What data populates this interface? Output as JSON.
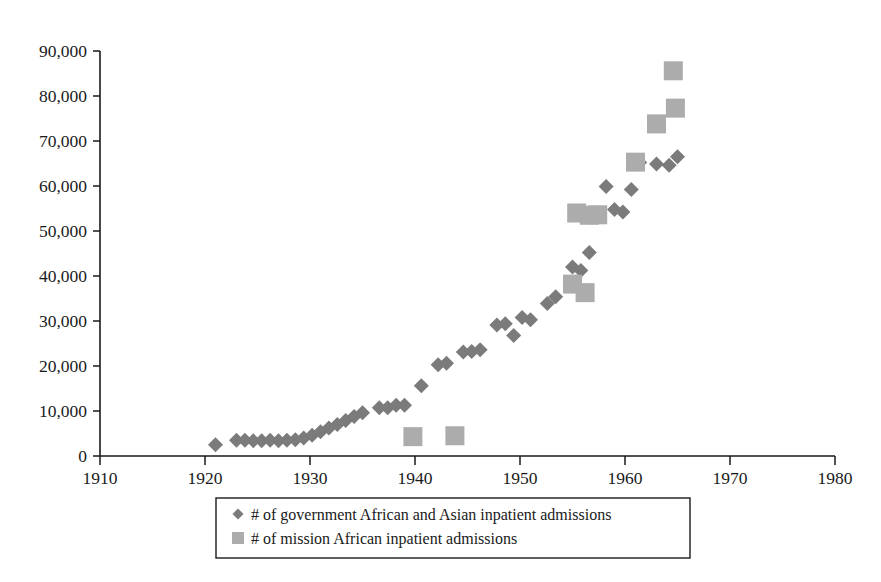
{
  "chart_data": {
    "type": "scatter",
    "title": "",
    "subtitle": "",
    "xlabel": "",
    "ylabel": "",
    "xlim": [
      1910,
      1980
    ],
    "ylim": [
      0,
      90000
    ],
    "grid": false,
    "legend_position": "bottom",
    "x_ticks": [
      "1910",
      "1920",
      "1930",
      "1940",
      "1950",
      "1960",
      "1970",
      "1980"
    ],
    "x_tick_values": [
      1910,
      1920,
      1930,
      1940,
      1950,
      1960,
      1970,
      1980
    ],
    "y_ticks": [
      "0",
      "10,000",
      "20,000",
      "30,000",
      "40,000",
      "50,000",
      "60,000",
      "70,000",
      "80,000",
      "90,000"
    ],
    "y_tick_values": [
      0,
      10000,
      20000,
      30000,
      40000,
      50000,
      60000,
      70000,
      80000,
      90000
    ],
    "series": [
      {
        "name": "# of government African and Asian inpatient admissions",
        "marker": "diamond",
        "color": "#7b7b7b",
        "points": [
          [
            1921.0,
            2500
          ],
          [
            1923.0,
            3500
          ],
          [
            1923.8,
            3500
          ],
          [
            1924.6,
            3400
          ],
          [
            1925.4,
            3400
          ],
          [
            1926.2,
            3500
          ],
          [
            1927.0,
            3400
          ],
          [
            1927.8,
            3500
          ],
          [
            1928.6,
            3600
          ],
          [
            1929.4,
            4000
          ],
          [
            1930.2,
            4600
          ],
          [
            1931.0,
            5400
          ],
          [
            1931.8,
            6200
          ],
          [
            1932.6,
            7000
          ],
          [
            1933.4,
            7900
          ],
          [
            1934.2,
            8800
          ],
          [
            1935.0,
            9600
          ],
          [
            1936.6,
            10700
          ],
          [
            1937.4,
            10700
          ],
          [
            1938.2,
            11300
          ],
          [
            1939.0,
            11300
          ],
          [
            1940.6,
            15600
          ],
          [
            1942.2,
            20300
          ],
          [
            1943.0,
            20600
          ],
          [
            1944.6,
            23100
          ],
          [
            1945.4,
            23200
          ],
          [
            1946.2,
            23600
          ],
          [
            1947.8,
            29100
          ],
          [
            1948.6,
            29400
          ],
          [
            1949.4,
            26800
          ],
          [
            1950.2,
            30800
          ],
          [
            1951.0,
            30300
          ],
          [
            1952.6,
            33900
          ],
          [
            1953.4,
            35400
          ],
          [
            1955.0,
            42000
          ],
          [
            1955.8,
            41200
          ],
          [
            1956.6,
            45200
          ],
          [
            1958.2,
            59900
          ],
          [
            1959.0,
            54800
          ],
          [
            1959.8,
            54200
          ],
          [
            1960.6,
            59200
          ],
          [
            1961.4,
            65200
          ],
          [
            1963.0,
            64900
          ],
          [
            1964.2,
            64600
          ],
          [
            1965.0,
            66500
          ]
        ]
      },
      {
        "name": "# of mission African inpatient admissions",
        "marker": "square",
        "color": "#acacac",
        "points": [
          [
            1939.8,
            4300
          ],
          [
            1943.8,
            4500
          ],
          [
            1955.0,
            38200
          ],
          [
            1956.2,
            36300
          ],
          [
            1955.4,
            54000
          ],
          [
            1956.6,
            53500
          ],
          [
            1957.4,
            53600
          ],
          [
            1961.0,
            65300
          ],
          [
            1963.0,
            73800
          ],
          [
            1964.8,
            77300
          ],
          [
            1964.6,
            85600
          ]
        ]
      }
    ]
  },
  "legend": {
    "items": [
      {
        "marker": "diamond",
        "label": "# of government African and Asian inpatient admissions"
      },
      {
        "marker": "square",
        "label": "# of mission African inpatient admissions"
      }
    ]
  },
  "colors": {
    "government_marker": "#7b7b7b",
    "mission_marker": "#acacac",
    "axis": "#1a1a1a",
    "background": "#ffffff"
  }
}
